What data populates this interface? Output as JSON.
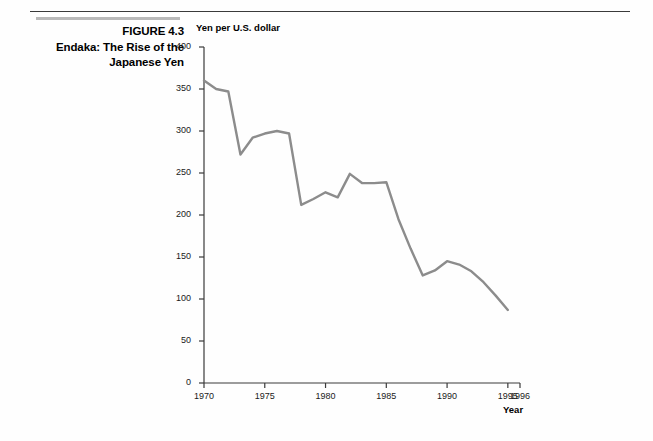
{
  "figure": {
    "number_label": "FIGURE 4.3",
    "title_line1": "Endaka: The Rise of the",
    "title_line2": "Japanese Yen"
  },
  "chart_data": {
    "type": "line",
    "title": "",
    "ylabel": "Yen per U.S. dollar",
    "xlabel": "Year",
    "ylim": [
      0,
      400
    ],
    "xlim": [
      1970,
      1996
    ],
    "grid": false,
    "legend": null,
    "line_color": "#8c8c8c",
    "axis_color": "#3a3a3a",
    "y_ticks": [
      0,
      50,
      100,
      150,
      200,
      250,
      300,
      350,
      400
    ],
    "y_tick_labels": [
      "0",
      "50",
      "100",
      "150",
      "200",
      "250",
      "300",
      "350",
      "400"
    ],
    "x_ticks": [
      1970,
      1975,
      1980,
      1985,
      1990,
      1995,
      1996
    ],
    "x_tick_labels": [
      "1970",
      "1975",
      "1980",
      "1985",
      "1990",
      "1995",
      "1996"
    ],
    "x": [
      1970,
      1971,
      1972,
      1973,
      1974,
      1975,
      1976,
      1977,
      1978,
      1979,
      1980,
      1981,
      1982,
      1983,
      1984,
      1985,
      1986,
      1987,
      1988,
      1989,
      1990,
      1991,
      1992,
      1993,
      1994,
      1995
    ],
    "values": [
      360,
      350,
      347,
      272,
      292,
      297,
      300,
      297,
      212,
      219,
      227,
      221,
      249,
      238,
      238,
      239,
      195,
      160,
      128,
      134,
      145,
      141,
      133,
      120,
      104,
      87
    ],
    "series": [
      {
        "name": "Yen per U.S. dollar",
        "values": [
          360,
          350,
          347,
          272,
          292,
          297,
          300,
          297,
          212,
          219,
          227,
          221,
          249,
          238,
          238,
          239,
          195,
          160,
          128,
          134,
          145,
          141,
          133,
          120,
          104,
          87
        ]
      }
    ]
  }
}
